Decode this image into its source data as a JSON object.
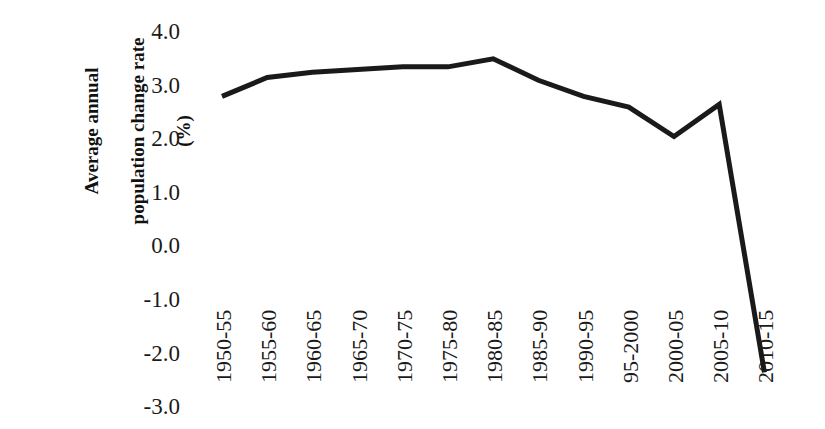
{
  "chart_data": {
    "type": "line",
    "title": "",
    "xlabel": "",
    "ylabel": "Average annual population change rate (%)",
    "ylabel_lines": [
      "Average annual",
      "population change rate",
      "(%)"
    ],
    "categories": [
      "1950-55",
      "1955-60",
      "1960-65",
      "1965-70",
      "1970-75",
      "1975-80",
      "1980-85",
      "1985-90",
      "1990-95",
      "95-2000",
      "2000-05",
      "2005-10",
      "2010-15"
    ],
    "values": [
      2.8,
      3.15,
      3.25,
      3.3,
      3.35,
      3.35,
      3.5,
      3.1,
      2.8,
      2.6,
      2.05,
      2.65,
      -2.35
    ],
    "series": [
      {
        "name": "Average annual population change rate",
        "values": [
          2.8,
          3.15,
          3.25,
          3.3,
          3.35,
          3.35,
          3.5,
          3.1,
          2.8,
          2.6,
          2.05,
          2.65,
          -2.35
        ]
      }
    ],
    "ylim": [
      -3.0,
      4.0
    ],
    "yticks": [
      4.0,
      3.0,
      2.0,
      1.0,
      0.0,
      -1.0,
      -2.0,
      -3.0
    ],
    "ytick_labels": [
      "4.0",
      "3.0",
      "2.0",
      "1.0",
      "0.0",
      "-1.0",
      "-2.0",
      "-3.0"
    ],
    "grid": false,
    "legend": "none",
    "line_color": "#1a1a1a",
    "line_width": 5,
    "background_color": "#ffffff"
  }
}
